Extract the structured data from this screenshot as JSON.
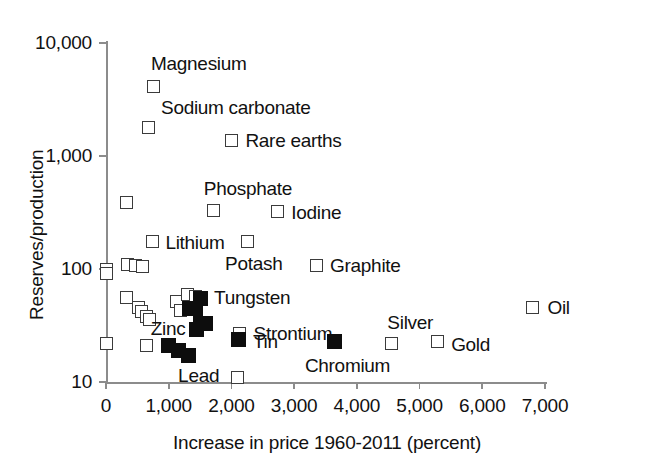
{
  "chart_data": {
    "type": "scatter",
    "title": "",
    "xlabel": "Increase in price 1960-2011 (percent)",
    "ylabel": "Reserves/production",
    "xlim": [
      0,
      7000
    ],
    "ylim": [
      10,
      10000
    ],
    "yscale": "log",
    "xscale": "linear",
    "grid": false,
    "legend": null,
    "xticks": [
      "0",
      "1,000",
      "2,000",
      "3,000",
      "4,000",
      "5,000",
      "6,000",
      "7,000"
    ],
    "xtick_values": [
      0,
      1000,
      2000,
      3000,
      4000,
      5000,
      6000,
      7000
    ],
    "yticks": [
      "10",
      "100",
      "1,000",
      "10,000"
    ],
    "ytick_values": [
      10,
      100,
      1000,
      10000
    ],
    "marker_styles": {
      "open": "open white square with dark outline",
      "filled": "solid black square"
    },
    "points": [
      {
        "label": "Magnesium",
        "x": 750,
        "y": 4100,
        "style": "open",
        "label_dx": -2,
        "label_dy": -24,
        "label_anchor": "left"
      },
      {
        "label": "Sodium carbonate",
        "x": 670,
        "y": 1800,
        "style": "open",
        "label_dx": 13,
        "label_dy": -20,
        "label_anchor": "left"
      },
      {
        "label": "Rare earths",
        "x": 2000,
        "y": 1380,
        "style": "open",
        "label_dx": 14,
        "label_dy": 0,
        "label_anchor": "left"
      },
      {
        "label": "Phosphate",
        "x": 1720,
        "y": 330,
        "style": "open",
        "label_dx": -10,
        "label_dy": -22,
        "label_anchor": "left"
      },
      {
        "label": "Iodine",
        "x": 2730,
        "y": 320,
        "style": "open",
        "label_dx": 14,
        "label_dy": 0,
        "label_anchor": "left"
      },
      {
        "label": "Lithium",
        "x": 740,
        "y": 175,
        "style": "open",
        "label_dx": 13,
        "label_dy": 0,
        "label_anchor": "left"
      },
      {
        "label": "Potash",
        "x": 2250,
        "y": 175,
        "style": "open",
        "label_dx": -22,
        "label_dy": 21,
        "label_anchor": "left"
      },
      {
        "label": "Graphite",
        "x": 3350,
        "y": 108,
        "style": "open",
        "label_dx": 14,
        "label_dy": 0,
        "label_anchor": "left"
      },
      {
        "label": "Tungsten",
        "x": 1500,
        "y": 55,
        "style": "filled",
        "label_dx": 14,
        "label_dy": -1,
        "label_anchor": "left"
      },
      {
        "label": "Strontium",
        "x": 2130,
        "y": 27,
        "style": "open",
        "label_dx": 14,
        "label_dy": 0,
        "label_anchor": "left"
      },
      {
        "label": "Zinc",
        "x": 1000,
        "y": 21,
        "style": "filled",
        "label_dx": -18,
        "label_dy": -18,
        "label_anchor": "left"
      },
      {
        "label": "Tin",
        "x": 2120,
        "y": 24,
        "style": "filled",
        "label_dx": 14,
        "label_dy": 2,
        "label_anchor": "left"
      },
      {
        "label": "Lead",
        "x": 1150,
        "y": 19,
        "style": "filled",
        "label_dx": 0,
        "label_dy": 24,
        "label_anchor": "left"
      },
      {
        "label": "Chromium",
        "x": 3650,
        "y": 23,
        "style": "filled",
        "label_dx": -30,
        "label_dy": 24,
        "label_anchor": "left"
      },
      {
        "label": "Silver",
        "x": 4550,
        "y": 22,
        "style": "open",
        "label_dx": -4,
        "label_dy": -21,
        "label_anchor": "left"
      },
      {
        "label": "Gold",
        "x": 5280,
        "y": 23,
        "style": "open",
        "label_dx": 14,
        "label_dy": 3,
        "label_anchor": "left"
      },
      {
        "label": "Oil",
        "x": 6800,
        "y": 46,
        "style": "open",
        "label_dx": 15,
        "label_dy": 0,
        "label_anchor": "left"
      }
    ],
    "unlabeled_points": [
      {
        "x": 330,
        "y": 390,
        "style": "open"
      },
      {
        "x": 0,
        "y": 100,
        "style": "open"
      },
      {
        "x": 0,
        "y": 92,
        "style": "open"
      },
      {
        "x": 350,
        "y": 110,
        "style": "open"
      },
      {
        "x": 470,
        "y": 108,
        "style": "open"
      },
      {
        "x": 580,
        "y": 105,
        "style": "open"
      },
      {
        "x": 330,
        "y": 56,
        "style": "open"
      },
      {
        "x": 520,
        "y": 46,
        "style": "open"
      },
      {
        "x": 560,
        "y": 42,
        "style": "open"
      },
      {
        "x": 640,
        "y": 38,
        "style": "open"
      },
      {
        "x": 700,
        "y": 36,
        "style": "open"
      },
      {
        "x": 1130,
        "y": 52,
        "style": "open"
      },
      {
        "x": 1180,
        "y": 43,
        "style": "open"
      },
      {
        "x": 1300,
        "y": 60,
        "style": "open"
      },
      {
        "x": 1420,
        "y": 57,
        "style": "open"
      },
      {
        "x": 1330,
        "y": 45,
        "style": "filled"
      },
      {
        "x": 1430,
        "y": 45,
        "style": "filled"
      },
      {
        "x": 1500,
        "y": 33,
        "style": "filled"
      },
      {
        "x": 1580,
        "y": 33,
        "style": "filled"
      },
      {
        "x": 1450,
        "y": 29,
        "style": "filled"
      },
      {
        "x": 0,
        "y": 22,
        "style": "open"
      },
      {
        "x": 650,
        "y": 21,
        "style": "open"
      },
      {
        "x": 1320,
        "y": 17,
        "style": "filled"
      },
      {
        "x": 2100,
        "y": 11,
        "style": "open"
      }
    ]
  },
  "axis": {
    "x_title": "Increase in price 1960-2011 (percent)",
    "y_title": "Reserves/production"
  }
}
